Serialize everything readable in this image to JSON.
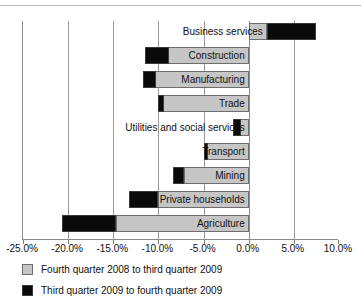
{
  "chart_data": {
    "type": "bar",
    "orientation": "horizontal",
    "stacked": true,
    "title": "",
    "xlabel": "",
    "ylabel": "",
    "xlim": [
      -25.0,
      10.0
    ],
    "xticks": [
      "-25.0%",
      "-20.0%",
      "-15.0%",
      "-10.0%",
      "-5.0%",
      "0.0%",
      "5.0%",
      "10.0%"
    ],
    "xtick_values": [
      -25.0,
      -20.0,
      -15.0,
      -10.0,
      -5.0,
      0.0,
      5.0,
      10.0
    ],
    "grid": true,
    "legend_position": "below",
    "categories": [
      "Business services",
      "Construction",
      "Manufacturing",
      "Trade",
      "Utilities and social services",
      "Transport",
      "Mining",
      "Private households",
      "Agriculture"
    ],
    "series": [
      {
        "name": "Fourth quarter 2008 to third quarter 2009",
        "color": "#c6c6c6",
        "values": [
          2.0,
          -11.5,
          -11.7,
          -10.1,
          -1.7,
          -4.9,
          -7.2,
          -10.0,
          -14.7
        ]
      },
      {
        "name": "Third quarter 2009 to fourth quarter 2009",
        "color": "#0a0a0a",
        "values": [
          5.5,
          2.7,
          1.4,
          0.7,
          0.8,
          0.35,
          -1.2,
          -3.3,
          -6.0
        ]
      }
    ]
  },
  "legend": {
    "items": [
      {
        "label": "Fourth quarter 2008 to third quarter 2009",
        "swatch": "gray"
      },
      {
        "label": "Third quarter 2009 to fourth quarter 2009",
        "swatch": "black"
      }
    ]
  }
}
